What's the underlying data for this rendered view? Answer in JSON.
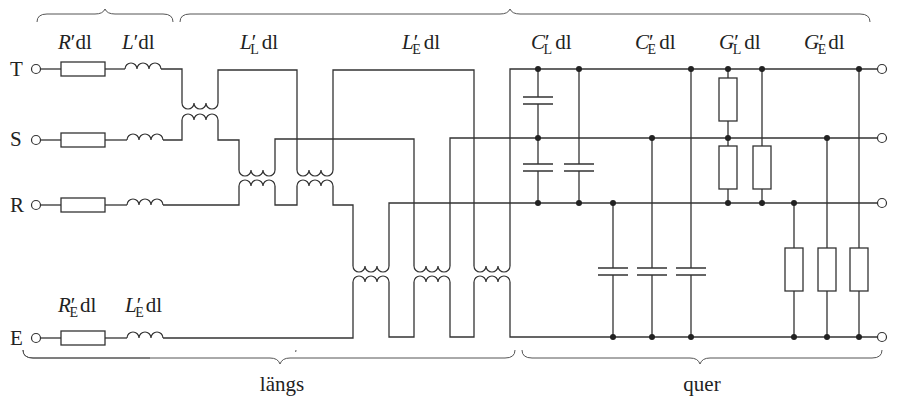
{
  "diagram": {
    "title_top_brace": "pp",
    "braces": {
      "left_top": "",
      "longitudinal_label": "längs",
      "transverse_label": "quer"
    },
    "terminals": [
      "T",
      "S",
      "R",
      "E"
    ],
    "series_labels": {
      "R": {
        "base": "R",
        "sub": "",
        "prime": "′",
        "rest": "dl"
      },
      "L": {
        "base": "L",
        "sub": "",
        "prime": "′",
        "rest": "dl"
      },
      "RE": {
        "base": "R",
        "sub": "E",
        "prime": "′",
        "rest": "dl"
      },
      "LE": {
        "base": "L",
        "sub": "E",
        "prime": "′",
        "rest": "dl"
      }
    },
    "coupling_labels": {
      "LL": {
        "base": "L",
        "sub": "L",
        "prime": "′",
        "rest": "dl"
      },
      "LE": {
        "base": "L",
        "sub": "E",
        "prime": "′",
        "rest": "dl"
      }
    },
    "shunt_labels": {
      "CL": {
        "base": "C",
        "sub": "L",
        "prime": "′",
        "rest": "dl"
      },
      "CE": {
        "base": "C",
        "sub": "E",
        "prime": "′",
        "rest": "dl"
      },
      "GL": {
        "base": "G",
        "sub": "L",
        "prime": "′",
        "rest": "dl"
      },
      "GE": {
        "base": "G",
        "sub": "E",
        "prime": "′",
        "rest": "dl"
      }
    },
    "colors": {
      "line": "#333333",
      "background": "#ffffff"
    }
  }
}
